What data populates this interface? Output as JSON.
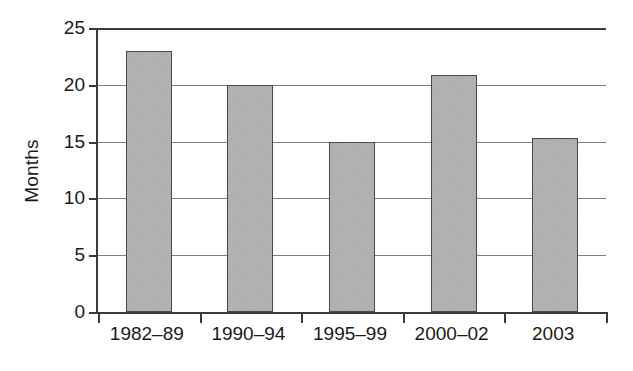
{
  "chart_data": {
    "type": "bar",
    "title": "",
    "subtitle": "",
    "xlabel": "",
    "ylabel": "Months",
    "categories": [
      "1982–89",
      "1990–94",
      "1995–99",
      "2000–02",
      "2003"
    ],
    "values": [
      23.0,
      20.0,
      15.0,
      20.9,
      15.3
    ],
    "ylim": [
      0,
      25
    ],
    "ytick_values": [
      0,
      5,
      10,
      15,
      20,
      25
    ],
    "ytick_labels": [
      "0",
      "5",
      "10",
      "15",
      "20",
      "25"
    ],
    "grid": "horizontal",
    "legend": "none",
    "series": [
      {
        "name": "Months",
        "values": [
          23.0,
          20.0,
          15.0,
          20.9,
          15.3
        ]
      }
    ],
    "colors": {
      "bar_fill": "#a9a9a9",
      "bar_border": "#4a4a4a",
      "axis": "#3a3a3a",
      "gridline": "#7d7d7d",
      "text": "#1a1a1a",
      "background": "#ffffff"
    }
  }
}
